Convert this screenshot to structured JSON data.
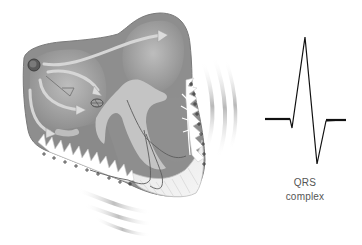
{
  "diagram": {
    "colors": {
      "heart_outer": "#8a8a8a",
      "heart_inner": "#b3b3b3",
      "heart_chamber": "#9c9c9c",
      "septum": "#c2c2c2",
      "arrow_fill": "#d4d4d4",
      "conduction_line": "#5a5a5a",
      "waves": "#cfcfcf",
      "ecg_trace": "#111111",
      "label_text": "#555555"
    },
    "elements": {
      "sa_node": "sinoatrial-node",
      "av_node": "atrioventricular-node",
      "bundle_branches": "left-and-right-bundle-branches",
      "purkinje_fibers": "purkinje-fibers",
      "charge_markers": "+",
      "depolarization_waves": "electrical-waves"
    }
  },
  "ecg": {
    "label_line1": "QRS",
    "label_line2": "complex",
    "trace_points": [
      [
        265,
        119
      ],
      [
        290,
        119
      ],
      [
        292,
        128
      ],
      [
        305,
        37
      ],
      [
        317,
        164
      ],
      [
        326,
        121
      ],
      [
        346,
        120
      ]
    ]
  }
}
